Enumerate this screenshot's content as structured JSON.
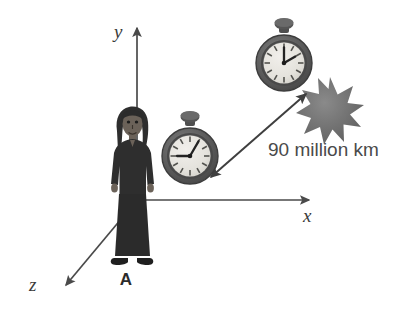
{
  "figure": {
    "background_color": "#ffffff"
  },
  "axes": {
    "color": "#4a4a4a",
    "y": {
      "label": "y",
      "name": "y-axis",
      "direction": "up"
    },
    "x": {
      "label": "x",
      "name": "x-axis",
      "direction": "right"
    },
    "z": {
      "label": "z",
      "name": "z-axis",
      "direction": "down-left"
    }
  },
  "observer": {
    "label": "A",
    "description": "standing person figure",
    "body_color": "#2e2e2e",
    "skin_color": "#6b6259"
  },
  "clocks": [
    {
      "name": "stopwatch-lower",
      "hour_hand_angle_deg": 270,
      "minute_hand_angle_deg": 30,
      "hand_positions": "9 and 1",
      "case_color": "#5d5d5d",
      "face_color": "#e8e6e1"
    },
    {
      "name": "stopwatch-upper",
      "hour_hand_angle_deg": 0,
      "minute_hand_angle_deg": 60,
      "hand_positions": "12 and 2",
      "case_color": "#5d5d5d",
      "face_color": "#e8e6e1"
    }
  ],
  "event": {
    "name": "starburst",
    "description": "star burst explosion marker",
    "color": "#6e6e6e",
    "points": 11
  },
  "measurement": {
    "label": "90 million km",
    "arrow": "double-headed",
    "color": "#3f3f3f"
  }
}
